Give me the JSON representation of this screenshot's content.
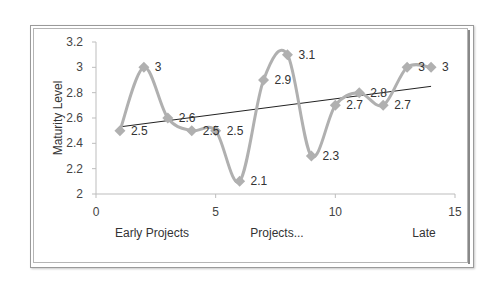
{
  "chart_data": {
    "type": "scatter",
    "title": "",
    "xlabel": "",
    "ylabel": "Maturity Level",
    "x_category_labels": [
      "Early Projects",
      "Projects...",
      "Late"
    ],
    "xlim": [
      0,
      15
    ],
    "ylim": [
      2,
      3.2
    ],
    "x_ticks": [
      "0",
      "5",
      "10",
      "15"
    ],
    "y_ticks": [
      "2",
      "2.2",
      "2.4",
      "2.6",
      "2.8",
      "3",
      "3.2"
    ],
    "grid": false,
    "legend": "none",
    "series": [
      {
        "name": "Maturity Level",
        "style": "smoothed line with diamond markers",
        "color": "#b0b0b0",
        "x": [
          1,
          2,
          3,
          4,
          5,
          6,
          7,
          8,
          9,
          10,
          11,
          12,
          13,
          14
        ],
        "values": [
          2.5,
          3,
          2.6,
          2.5,
          2.5,
          2.1,
          2.9,
          3.1,
          2.3,
          2.7,
          2.8,
          2.7,
          3,
          3
        ],
        "data_labels": [
          "2.5",
          "3",
          "2.6",
          "2.5",
          "2.5",
          "2.1",
          "2.9",
          "3.1",
          "2.3",
          "2.7",
          "2.8",
          "2.7",
          "3",
          "3"
        ]
      },
      {
        "name": "Linear trendline",
        "style": "line",
        "color": "#222222",
        "x": [
          1,
          14
        ],
        "values": [
          2.53,
          2.85
        ]
      }
    ]
  }
}
